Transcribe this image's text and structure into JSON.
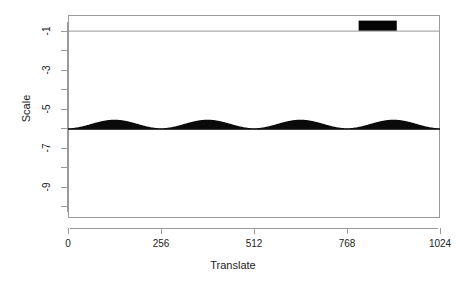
{
  "chart_data": {
    "type": "area",
    "title": "",
    "subtitle": "",
    "xlabel": "Translate",
    "ylabel": "Scale",
    "xlim": [
      0,
      1024
    ],
    "ylim": [
      -10.6,
      -0.2
    ],
    "grid": false,
    "legend": null,
    "plot_style": "wavelet-coefficient-stalk-plot",
    "x_ticks": [
      {
        "value": 0,
        "label": "0"
      },
      {
        "value": 256,
        "label": "256"
      },
      {
        "value": 512,
        "label": "512"
      },
      {
        "value": 768,
        "label": "768"
      },
      {
        "value": 1024,
        "label": "1024"
      }
    ],
    "y_ticks": [
      {
        "value": -9,
        "label": "-9"
      },
      {
        "value": -7,
        "label": "-7"
      },
      {
        "value": -5,
        "label": "-5"
      },
      {
        "value": -3,
        "label": "-3"
      },
      {
        "value": -1,
        "label": "-1"
      }
    ],
    "y_minor_ticks": [
      -10,
      -8,
      -6,
      -4,
      -2
    ],
    "series": [
      {
        "name": "level -6 coefficients",
        "baseline_scale": -6,
        "description": "Four sinusoidal humps of filled wavelet coefficient stalks along the level -6 row",
        "n_humps": 4,
        "hump_peaks_x": [
          128,
          384,
          640,
          896
        ],
        "hump_amplitude": 8.5,
        "color": "#000000"
      },
      {
        "name": "level -1 coefficients",
        "baseline_scale": -1,
        "description": "Flat near-zero baseline with one solid black burst of large coefficients",
        "burst_x_range": [
          800,
          905
        ],
        "burst_amplitude": 10,
        "color": "#000000"
      }
    ],
    "baselines": [
      {
        "scale": -6,
        "color": "#000000"
      },
      {
        "scale": -1,
        "color": "#999999"
      }
    ]
  },
  "axes": {
    "x_title": "Translate",
    "y_title": "Scale"
  },
  "colors": {
    "axis": "#9a9a9a",
    "frame": "#9a9a9a",
    "text": "#222222",
    "coefficient": "#000000",
    "baseline_faint": "#999999",
    "background": "#ffffff"
  }
}
